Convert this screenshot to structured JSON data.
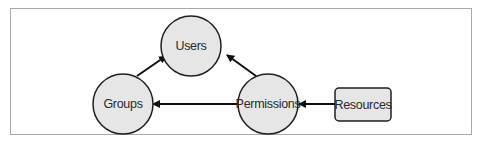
{
  "diagram": {
    "nodes": [
      {
        "id": "users",
        "label": "Users",
        "shape": "circle"
      },
      {
        "id": "groups",
        "label": "Groups",
        "shape": "circle"
      },
      {
        "id": "permissions",
        "label": "Permissions",
        "shape": "circle"
      },
      {
        "id": "resources",
        "label": "Resources",
        "shape": "rounded-rect"
      }
    ],
    "edges": [
      {
        "from": "groups",
        "to": "users"
      },
      {
        "from": "permissions",
        "to": "users"
      },
      {
        "from": "permissions",
        "to": "groups"
      },
      {
        "from": "resources",
        "to": "permissions"
      }
    ],
    "colors": {
      "node_fill": "#e6e6e6",
      "node_stroke": "#1f1f1f",
      "edge": "#111111",
      "frame": "#a9a9a9"
    }
  }
}
